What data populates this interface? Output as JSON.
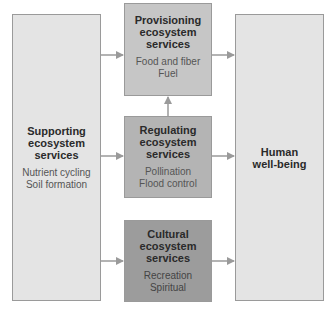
{
  "diagram": {
    "nodes": {
      "supporting": {
        "title_lines": [
          "Supporting",
          "ecosystem",
          "services"
        ],
        "items": [
          "Nutrient cycling",
          "Soil formation"
        ],
        "color": "#e4e4e4"
      },
      "provisioning": {
        "title_lines": [
          "Provisioning",
          "ecosystem",
          "services"
        ],
        "items": [
          "Food and fiber",
          "Fuel"
        ],
        "color": "#c6c6c6"
      },
      "regulating": {
        "title_lines": [
          "Regulating",
          "ecosystem",
          "services"
        ],
        "items": [
          "Pollination",
          "Flood control"
        ],
        "color": "#b4b4b4"
      },
      "cultural": {
        "title_lines": [
          "Cultural",
          "ecosystem",
          "services"
        ],
        "items": [
          "Recreation",
          "Spiritual"
        ],
        "color": "#9c9c9c"
      },
      "human": {
        "title_lines": [
          "Human",
          "well-being"
        ],
        "items": [],
        "color": "#e4e4e4"
      }
    },
    "edges": [
      {
        "from": "supporting",
        "to": "provisioning"
      },
      {
        "from": "supporting",
        "to": "regulating"
      },
      {
        "from": "supporting",
        "to": "cultural"
      },
      {
        "from": "regulating",
        "to": "provisioning"
      },
      {
        "from": "provisioning",
        "to": "human"
      },
      {
        "from": "regulating",
        "to": "human"
      },
      {
        "from": "cultural",
        "to": "human"
      }
    ],
    "arrow_color": "#9a9a9a"
  }
}
